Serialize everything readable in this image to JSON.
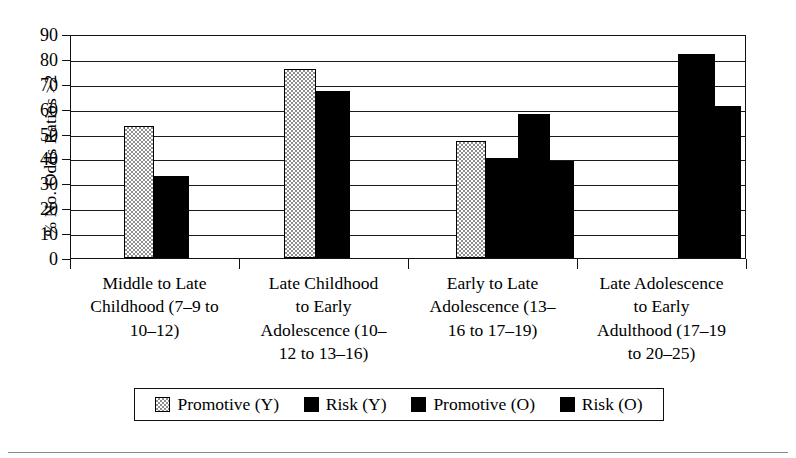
{
  "chart_data": {
    "type": "bar",
    "title": "",
    "xlabel": "",
    "ylabel": "% No. Odds Ratios >2",
    "ylim": [
      0,
      90
    ],
    "yticks": [
      0,
      10,
      20,
      30,
      40,
      50,
      60,
      70,
      80,
      90
    ],
    "grid": true,
    "legend_position": "bottom",
    "categories": [
      "Middle to Late Childhood (7–9 to 10–12)",
      "Late Childhood to Early Adolescence (10–12 to 13–16)",
      "Early to Late Adolescence (13–16 to 17–19)",
      "Late Adolescence to Early Adulthood (17–19 to 20–25)"
    ],
    "series": [
      {
        "name": "Promotive (Y)",
        "color": "#8f8f8f",
        "values": [
          53,
          76,
          47,
          null
        ]
      },
      {
        "name": "Risk (Y)",
        "color": "#000000",
        "values": [
          33,
          67,
          40,
          null
        ]
      },
      {
        "name": "Promotive (O)",
        "color": "#000000",
        "values": [
          null,
          null,
          58,
          82
        ]
      },
      {
        "name": "Risk (O)",
        "color": "#000000",
        "values": [
          null,
          null,
          39,
          61
        ]
      }
    ]
  },
  "axis": {
    "ylabel": "% No. Odds Ratios >2",
    "ytick_labels": [
      "90",
      "80",
      "70",
      "60",
      "50",
      "40",
      "30",
      "20",
      "10",
      "0"
    ]
  },
  "xlabels": [
    {
      "lines": [
        "Middle to Late",
        "Childhood (7–9 to",
        "10–12)"
      ]
    },
    {
      "lines": [
        "Late Childhood",
        "to Early",
        "Adolescence (10–",
        "12 to 13–16)"
      ]
    },
    {
      "lines": [
        "Early to Late",
        "Adolescence (13–",
        "16 to 17–19)"
      ]
    },
    {
      "lines": [
        "Late Adolescence",
        "to Early",
        "Adulthood (17–19",
        "to 20–25)"
      ]
    }
  ],
  "legend": {
    "items": [
      {
        "label": "Promotive (Y)",
        "swatch": "gray"
      },
      {
        "label": "Risk (Y)",
        "swatch": "black"
      },
      {
        "label": "Promotive (O)",
        "swatch": "black"
      },
      {
        "label": "Risk (O)",
        "swatch": "black"
      }
    ]
  },
  "colors": {
    "promotive_young": "#8f8f8f",
    "risk": "#000000",
    "axis": "#111111"
  }
}
